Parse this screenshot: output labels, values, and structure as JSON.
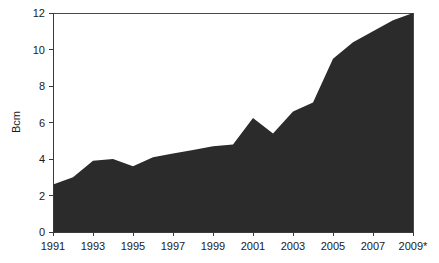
{
  "chart_data": {
    "type": "area",
    "title": "",
    "subtitle": "",
    "xlabel": "",
    "ylabel": "Bcm",
    "x": [
      1991,
      1992,
      1993,
      1994,
      1995,
      1996,
      1997,
      1998,
      1999,
      2000,
      2001,
      2002,
      2003,
      2004,
      2005,
      2006,
      2007,
      2008,
      2009
    ],
    "values": [
      2.6,
      3.0,
      3.9,
      4.0,
      3.6,
      4.1,
      4.3,
      4.5,
      4.7,
      4.8,
      6.25,
      5.4,
      6.6,
      7.1,
      9.5,
      10.4,
      11.0,
      11.6,
      12.0
    ],
    "series": [
      {
        "name": "Bcm",
        "color": "#2b2b2b",
        "values": [
          2.6,
          3.0,
          3.9,
          4.0,
          3.6,
          4.1,
          4.3,
          4.5,
          4.7,
          4.8,
          6.25,
          5.4,
          6.6,
          7.1,
          9.5,
          10.4,
          11.0,
          11.6,
          12.0
        ]
      }
    ],
    "xlim": [
      1991,
      2009
    ],
    "ylim": [
      0,
      12
    ],
    "yticks": [
      0,
      2,
      4,
      6,
      8,
      10,
      12
    ],
    "ytick_labels": [
      "0",
      "2",
      "4",
      "6",
      "8",
      "10",
      "12"
    ],
    "xticks": [
      1991,
      1993,
      1995,
      1997,
      1999,
      2001,
      2003,
      2005,
      2007,
      2009
    ],
    "xtick_labels": [
      "1991",
      "1993",
      "1995",
      "1997",
      "1999",
      "2001",
      "2003",
      "2005",
      "2007",
      "2009*"
    ],
    "grid": false,
    "legend": "none",
    "annotations": [],
    "fill_color": "#2b2b2b",
    "axis_color": "#3a3a3a",
    "background_color": "#ffffff"
  }
}
